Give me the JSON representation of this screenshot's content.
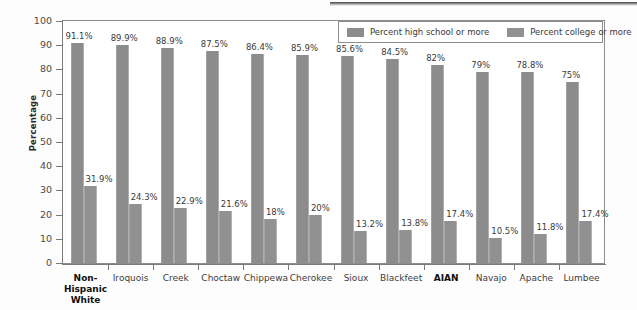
{
  "chart_data": {
    "type": "bar",
    "title": "",
    "xlabel": "",
    "ylabel": "Percentage",
    "ylim": [
      0,
      100
    ],
    "ytick_step": 10,
    "grid": false,
    "legend_position": "top-right",
    "legend_box": true,
    "categories": [
      "Non-Hispanic White",
      "Iroquois",
      "Creek",
      "Choctaw",
      "Chippewa",
      "Cherokee",
      "Sioux",
      "Blackfeet",
      "AIAN",
      "Navajo",
      "Apache",
      "Lumbee"
    ],
    "category_bold": [
      true,
      false,
      false,
      false,
      false,
      false,
      false,
      false,
      true,
      false,
      false,
      false
    ],
    "yticks": [
      "0",
      "10",
      "20",
      "30",
      "40",
      "50",
      "60",
      "70",
      "80",
      "90",
      "100"
    ],
    "series": [
      {
        "name": "Percent high school or more",
        "color": "#8c8c8c",
        "values": [
          91.1,
          89.9,
          88.9,
          87.5,
          86.4,
          85.9,
          85.6,
          84.5,
          82,
          79,
          78.8,
          75
        ],
        "labels": [
          "91.1%",
          "89.9%",
          "88.9%",
          "87.5%",
          "86.4%",
          "85.9%",
          "85.6%",
          "84.5%",
          "82%",
          "79%",
          "78.8%",
          "75%"
        ]
      },
      {
        "name": "Percent college or more",
        "color": "#919191",
        "values": [
          31.9,
          24.3,
          22.9,
          21.6,
          18,
          20,
          13.2,
          13.8,
          17.4,
          10.5,
          11.8,
          17.4
        ],
        "labels": [
          "31.9%",
          "24.3%",
          "22.9%",
          "21.6%",
          "18%",
          "20%",
          "13.2%",
          "13.8%",
          "17.4%",
          "10.5%",
          "11.8%",
          "17.4%"
        ]
      }
    ]
  }
}
